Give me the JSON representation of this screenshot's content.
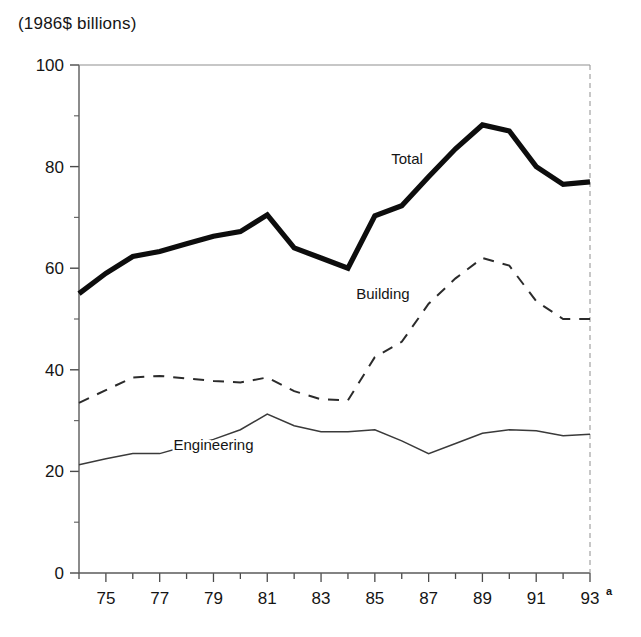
{
  "chart_data": {
    "type": "line",
    "title": "(1986$ billions)",
    "xlabel": "",
    "ylabel": "(1986$ billions)",
    "ylim": [
      0,
      100
    ],
    "xlim": [
      74,
      93
    ],
    "yticks": [
      0,
      20,
      40,
      60,
      80,
      100
    ],
    "ytick_labels": [
      "0",
      "20",
      "40",
      "60",
      "80",
      "100"
    ],
    "xticks": [
      74,
      75,
      76,
      77,
      78,
      79,
      80,
      81,
      82,
      83,
      84,
      85,
      86,
      87,
      88,
      89,
      90,
      91,
      92,
      93
    ],
    "xtick_labels": [
      "75",
      "77",
      "79",
      "81",
      "83",
      "85",
      "87",
      "89",
      "91",
      "93"
    ],
    "xtick_label_years": [
      75,
      77,
      79,
      81,
      83,
      85,
      87,
      89,
      91,
      93
    ],
    "footnote_marker": "a",
    "grid": false,
    "legend_position": "inline-annotations",
    "x": [
      74,
      75,
      76,
      77,
      78,
      79,
      80,
      81,
      82,
      83,
      84,
      85,
      86,
      87,
      88,
      89,
      90,
      91,
      92,
      93
    ],
    "series": [
      {
        "name": "Total",
        "style": "thick-solid",
        "label_x": 86.2,
        "label_y": 80.5,
        "values": [
          55.0,
          59.0,
          62.3,
          63.3,
          64.8,
          66.3,
          67.2,
          70.5,
          64.0,
          62.0,
          60.0,
          70.3,
          72.3,
          78.0,
          83.5,
          88.2,
          87.0,
          80.0,
          76.5,
          77.0
        ]
      },
      {
        "name": "Building",
        "style": "dashed",
        "label_x": 85.3,
        "label_y": 54.0,
        "values": [
          33.5,
          36.0,
          38.5,
          38.8,
          38.3,
          37.8,
          37.5,
          38.5,
          35.8,
          34.2,
          34.0,
          42.5,
          45.5,
          53.0,
          58.0,
          62.0,
          60.5,
          53.5,
          50.0,
          50.0
        ]
      },
      {
        "name": "Engineering",
        "style": "thin-solid",
        "label_x": 79.0,
        "label_y": 24.3,
        "values": [
          21.3,
          22.5,
          23.5,
          23.5,
          25.0,
          26.3,
          28.2,
          31.3,
          29.0,
          27.8,
          27.8,
          28.2,
          26.0,
          23.5,
          25.5,
          27.5,
          28.2,
          28.0,
          27.0,
          27.3
        ]
      }
    ]
  },
  "geometry": {
    "plot_left": 79,
    "plot_right": 590,
    "plot_top": 65,
    "plot_bottom": 573
  }
}
